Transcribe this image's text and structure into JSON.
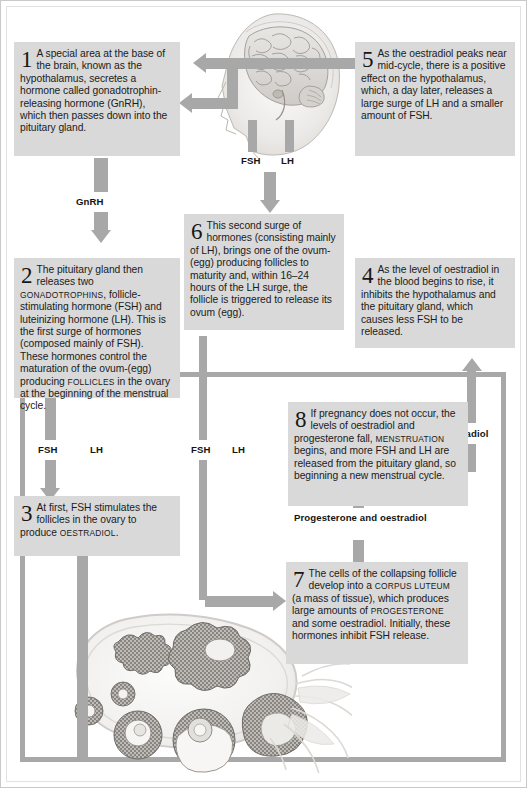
{
  "diagram": {
    "accent_color": "#a8a8a8",
    "box_color": "#d9d9d9"
  },
  "steps": [
    {
      "number": "1",
      "text": "A special area at the base of the brain, known as the hypothalamus, secretes a hormone called gonadotrophin-releasing hormone (GnRH), which then passes down into the pituitary gland."
    },
    {
      "number": "2",
      "text_a": "The pituitary gland then releases two ",
      "sc_a": "GONADOTROPHINS",
      "text_b": ", follicle-stimulating hormone (FSH) and luteinizing hormone (LH). This is the first surge of hormones (composed mainly of FSH). These hormones control the maturation of the ovum-(egg) producing ",
      "sc_b": "FOLLICLES",
      "text_c": " in the ovary at the beginning of the menstrual cycle."
    },
    {
      "number": "3",
      "text_a": "At first, FSH stimulates the follicles in the ovary to produce ",
      "sc_a": "OESTRADIOL",
      "text_b": "."
    },
    {
      "number": "4",
      "text": "As the level of oestradiol in the blood begins to rise, it inhibits the hypothalamus and the pituitary gland, which causes less FSH to be released."
    },
    {
      "number": "5",
      "text": "As the oestradiol peaks near mid-cycle, there is a positive effect on the hypothalamus, which, a day later, releases a large surge of LH and a smaller amount of FSH."
    },
    {
      "number": "6",
      "text": "This second surge of hormones (consisting mainly of LH), brings one of the ovum-(egg) producing follicles to maturity and, within 16–24 hours of the LH surge, the follicle is triggered to release its ovum (egg)."
    },
    {
      "number": "7",
      "text_a": "The cells of the collapsing follicle develop into a ",
      "sc_a": "CORPUS LUTEUM",
      "text_b": " (a mass of tissue), which produces large amounts of ",
      "sc_b": "PROGESTERONE",
      "text_c": " and some oestradiol. Initially, these hormones inhibit FSH release."
    },
    {
      "number": "8",
      "text_a": "If pregnancy does not occur, the levels of oestradiol and progesterone fall, ",
      "sc_a": "MENSTRUATION",
      "text_b": " begins, and more FSH and LH are released from the pituitary gland, so beginning a new menstrual cycle."
    }
  ],
  "arrow_labels": {
    "gnrh": "GnRH",
    "head_fsh": "FSH",
    "head_lh": "LH",
    "left_fsh": "FSH",
    "left_lh": "LH",
    "mid_fsh": "FSH",
    "mid_lh": "LH",
    "oestradiol": "Oestradiol",
    "progesterone_oestradiol": "Progesterone and oestradiol"
  },
  "artwork": {
    "head": "anatomical-head-brain-illustration",
    "ovary": "ovary-follicles-illustration"
  }
}
